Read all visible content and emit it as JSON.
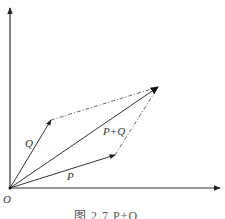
{
  "figure": {
    "caption": "图 2.7   P+Q",
    "labels": {
      "origin": "O",
      "p": "P",
      "q": "Q",
      "sum": "P+Q"
    },
    "colors": {
      "line": "#333333",
      "dashed": "#555555",
      "background": "#ffffff"
    }
  },
  "vectors": [
    {
      "name": "P",
      "from": [
        10,
        188
      ],
      "to": [
        115,
        155
      ],
      "style": "solid"
    },
    {
      "name": "Q",
      "from": [
        10,
        188
      ],
      "to": [
        51,
        120
      ],
      "style": "solid"
    },
    {
      "name": "P+Q",
      "from": [
        10,
        188
      ],
      "to": [
        158,
        87
      ],
      "style": "solid"
    },
    {
      "name": "Q-translated",
      "from": [
        115,
        155
      ],
      "to": [
        158,
        87
      ],
      "style": "dash-dot"
    },
    {
      "name": "P-translated",
      "from": [
        51,
        120
      ],
      "to": [
        158,
        87
      ],
      "style": "dash-dot"
    }
  ],
  "axes": {
    "origin": [
      10,
      188
    ],
    "x_end": [
      220,
      188
    ],
    "y_end": [
      10,
      8
    ]
  }
}
